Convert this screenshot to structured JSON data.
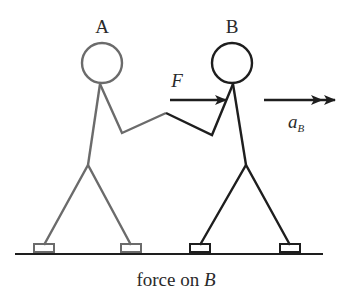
{
  "labels": {
    "person_a": "A",
    "person_b": "B",
    "force": "F",
    "accel_main": "a",
    "accel_sub": "B",
    "caption_prefix": "force on ",
    "caption_var": "B"
  },
  "colors": {
    "person_a": "#6b6b6b",
    "person_b": "#1e1e1e",
    "arrow": "#1e1e1e",
    "ground": "#1e1e1e",
    "text": "#2a2a2a"
  },
  "arrows": {
    "force": {
      "label": "F",
      "direction": "right",
      "heads": 1
    },
    "acceleration": {
      "label": "a_B",
      "direction": "right",
      "heads": 2
    }
  }
}
